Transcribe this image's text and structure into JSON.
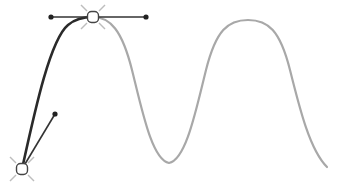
{
  "canvas": {
    "width": 345,
    "height": 190,
    "background": "#ffffff"
  },
  "colors": {
    "active_segment": "#2a2a2a",
    "inactive_path": "#a8a8a8",
    "handle_line": "#333333",
    "handle_point": "#222222",
    "anchor_stroke": "#444444",
    "anchor_fill": "#ffffff",
    "anchor_rays": "#bdbdbd"
  },
  "active_segment_path": "M22,169 C35,110 50,40 68,25 C75,19 83,17 93,17",
  "inactive_path": "M93,17 C110,17 122,30 132,70 C142,110 152,160 169,163 C186,160 196,110 206,70 C216,30 228,20 248,20 C268,20 280,30 290,70 C300,110 310,150 327,167",
  "anchors": [
    {
      "id": "top-anchor",
      "x": 93,
      "y": 17,
      "handles": [
        {
          "x": 51,
          "y": 17
        },
        {
          "x": 146,
          "y": 17
        }
      ]
    },
    {
      "id": "bottom-anchor",
      "x": 22,
      "y": 169,
      "handles": [
        {
          "x": 55,
          "y": 114
        }
      ]
    }
  ]
}
